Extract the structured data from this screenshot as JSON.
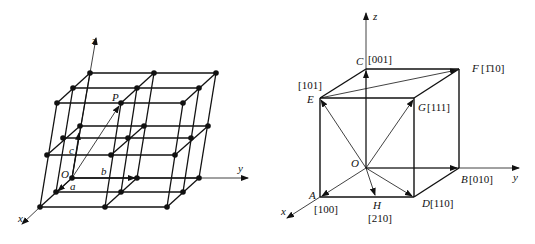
{
  "left_figure": {
    "title": "space lattice",
    "axes": {
      "x": "x",
      "y": "y",
      "z": "z"
    },
    "origin": "O",
    "vectors": {
      "a": "a",
      "b": "b",
      "c": "c"
    },
    "point": "P"
  },
  "right_figure": {
    "title": "crystal directions in cubic cell",
    "axes": {
      "x": "x",
      "y": "y",
      "z": "z"
    },
    "origin": "O",
    "points": [
      {
        "letter": "A",
        "index": "[100]"
      },
      {
        "letter": "B",
        "index": "[010]"
      },
      {
        "letter": "C",
        "index": "[001]"
      },
      {
        "letter": "D",
        "index": "[110]"
      },
      {
        "letter": "E",
        "index": "[101]"
      },
      {
        "letter": "F",
        "index": "[1̄10]"
      },
      {
        "letter": "G",
        "index": "[111]"
      },
      {
        "letter": "H",
        "index": "[210]"
      }
    ]
  }
}
